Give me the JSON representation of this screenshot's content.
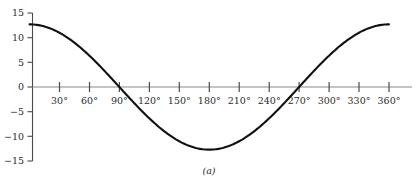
{
  "chart_data": {
    "type": "line",
    "title": "",
    "subtitle": "",
    "caption": "(a)",
    "xlabel": "",
    "ylabel": "",
    "xlim": [
      0,
      360
    ],
    "ylim": [
      -15,
      15
    ],
    "grid": false,
    "legend": null,
    "x_unit": "degrees",
    "x_tick_values": [
      30,
      60,
      90,
      120,
      150,
      180,
      210,
      240,
      270,
      300,
      330,
      360
    ],
    "x_tick_labels": [
      "30°",
      "60°",
      "90°",
      "120°",
      "150°",
      "180°",
      "210°",
      "240°",
      "270°",
      "300°",
      "330°",
      "360°"
    ],
    "y_tick_values": [
      15,
      10,
      5,
      0,
      -5,
      -10,
      -15
    ],
    "y_tick_labels": [
      "15",
      "10",
      "5",
      "0",
      "−5",
      "−10",
      "−15"
    ],
    "series": [
      {
        "name": "cosine",
        "amplitude": 12.7,
        "form": "12.7 cos(x)",
        "color": "#111111",
        "x": [
          0,
          10,
          20,
          30,
          40,
          50,
          60,
          70,
          80,
          90,
          100,
          110,
          120,
          130,
          140,
          150,
          160,
          170,
          180,
          190,
          200,
          210,
          220,
          230,
          240,
          250,
          260,
          270,
          280,
          290,
          300,
          310,
          320,
          330,
          340,
          350,
          360
        ],
        "values": [
          12.7,
          12.5,
          11.9,
          11.0,
          9.7,
          8.2,
          6.35,
          4.34,
          2.21,
          0.0,
          -2.21,
          -4.34,
          -6.35,
          -8.2,
          -9.7,
          -11.0,
          -11.9,
          -12.5,
          -12.7,
          -12.5,
          -11.9,
          -11.0,
          -9.7,
          -8.2,
          -6.35,
          -4.34,
          -2.21,
          0.0,
          2.21,
          4.34,
          6.35,
          8.2,
          9.7,
          11.0,
          11.9,
          12.5,
          12.7
        ]
      }
    ],
    "colors": {
      "curve": "#111111",
      "axis": "#8a8a8a",
      "tick": "#4a4a4a",
      "text": "#2b2b2b",
      "background": "#ffffff"
    }
  }
}
